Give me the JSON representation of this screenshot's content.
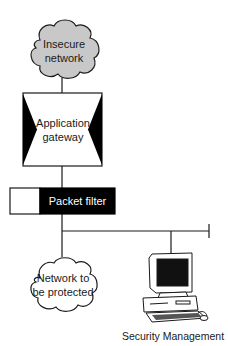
{
  "diagram": {
    "nodes": {
      "insecure_network": {
        "line1": "Insecure",
        "line2": "network",
        "shape": "cloud",
        "fill": "#c8c8c8"
      },
      "application_gateway": {
        "line1": "Application",
        "line2": "gateway",
        "shape": "box-with-inward-triangles"
      },
      "packet_filter": {
        "label": "Packet filter",
        "shape": "split-box",
        "fill": "#000000"
      },
      "protected_network": {
        "line1": "Network to",
        "line2": "be protected",
        "shape": "cloud",
        "fill": "#ffffff"
      },
      "security_management": {
        "label": "Security Management",
        "icon": "desktop-computer-icon"
      }
    },
    "edges": [
      [
        "insecure_network",
        "application_gateway"
      ],
      [
        "application_gateway",
        "packet_filter"
      ],
      [
        "packet_filter",
        "bus"
      ],
      [
        "bus",
        "protected_network"
      ],
      [
        "bus",
        "security_management"
      ]
    ]
  }
}
